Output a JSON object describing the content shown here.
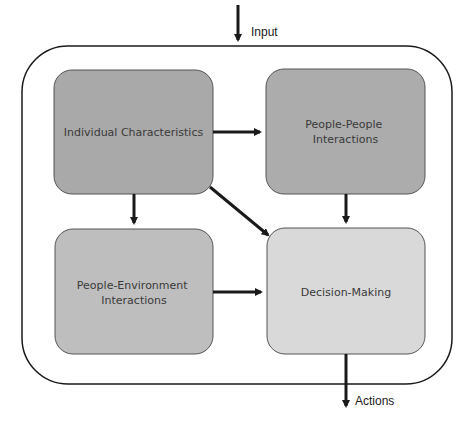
{
  "diagram": {
    "input_label": "Input",
    "output_label": "Actions",
    "nodes": {
      "individual": {
        "lines": [
          "Individual Characteristics"
        ],
        "fill": "#a9a9a9"
      },
      "people_people": {
        "lines": [
          "People-People",
          "Interactions"
        ],
        "fill": "#acacac"
      },
      "people_env": {
        "lines": [
          "People-Environment",
          "Interactions"
        ],
        "fill": "#bebebe"
      },
      "decision": {
        "lines": [
          "Decision-Making"
        ],
        "fill": "#d9d9d9"
      }
    },
    "edges": [
      {
        "from": "Input",
        "to": "System"
      },
      {
        "from": "Individual Characteristics",
        "to": "People-People Interactions"
      },
      {
        "from": "Individual Characteristics",
        "to": "People-Environment Interactions"
      },
      {
        "from": "Individual Characteristics",
        "to": "Decision-Making"
      },
      {
        "from": "People-People Interactions",
        "to": "Decision-Making"
      },
      {
        "from": "People-Environment Interactions",
        "to": "Decision-Making"
      },
      {
        "from": "Decision-Making",
        "to": "Actions"
      }
    ],
    "colors": {
      "stroke": "#1a1a1a",
      "box_border": "#555555"
    }
  }
}
